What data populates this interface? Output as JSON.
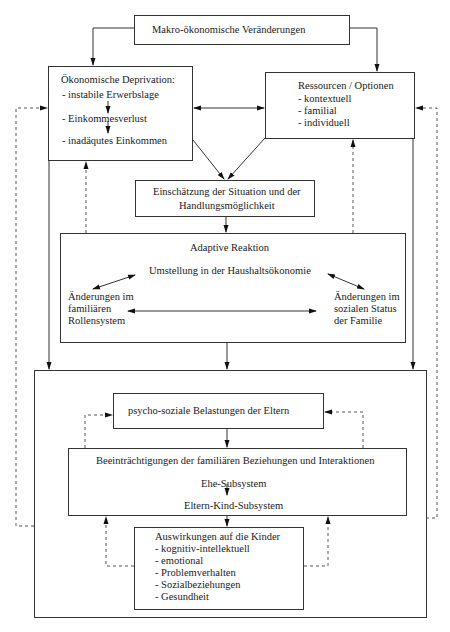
{
  "diagram": {
    "top_remnant": "...",
    "makro": {
      "label": "Makro-ökonomische Veränderungen"
    },
    "deprivation": {
      "title": "Ökonomische Deprivation:",
      "items": [
        "- instabile Erwerbslage",
        "- Einkommesverlust",
        "- inadäqutes Einkommen"
      ]
    },
    "ressourcen": {
      "title": "Ressourcen / Optionen",
      "items": [
        "- kontextuell",
        "- familial",
        "- individuell"
      ]
    },
    "einschaetzung": {
      "line1": "Einschätzung der Situation und der",
      "line2": "Handlungsmöglichkeit"
    },
    "adaptive": {
      "title": "Adaptive Reaktion",
      "center": "Umstellung in der Haushaltsökonomie",
      "left": [
        "Änderungen im",
        "familiären",
        "Rollensystem"
      ],
      "right": [
        "Änderungen im",
        "sozialen Status",
        "der Familie"
      ]
    },
    "psycho": {
      "label": "psycho-soziale Belastungen der Eltern"
    },
    "beeintraechtigungen": {
      "title": "Beeinträchtigungen der familiären Beziehungen und Interaktionen",
      "sub1": "Ehe-Subsystem",
      "sub2": "Eltern-Kind-Subsystem"
    },
    "auswirkungen": {
      "title": "Auswirkungen auf die Kinder",
      "items": [
        "- kognitiv-intellektuell",
        "- emotional",
        "- Problemverhalten",
        "- Sozialbeziehungen",
        "- Gesundheit"
      ]
    }
  }
}
